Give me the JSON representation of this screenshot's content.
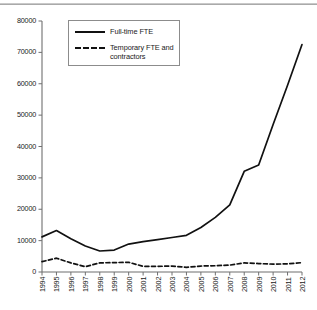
{
  "chart_data": {
    "type": "line",
    "title": "",
    "subtitle": "",
    "xlabel": "",
    "ylabel": "",
    "categories": [
      "1994",
      "1995",
      "1996",
      "1997",
      "1998",
      "1999",
      "2000",
      "2001",
      "2002",
      "2003",
      "2004",
      "2005",
      "2006",
      "2007",
      "2008",
      "2009",
      "2010",
      "2011",
      "2012"
    ],
    "ylim": [
      0,
      80000
    ],
    "ytick_values": [
      0,
      10000,
      20000,
      30000,
      40000,
      50000,
      60000,
      70000,
      80000
    ],
    "ytick_labels": [
      "0",
      "10000",
      "20000",
      "30000",
      "40000",
      "50000",
      "60000",
      "70000",
      "80000"
    ],
    "grid": false,
    "legend_position": "upper-left-inside",
    "series": [
      {
        "name": "Full-time FTE",
        "style": "solid",
        "color": "#111111",
        "values": [
          11200,
          13200,
          10600,
          8300,
          6700,
          7000,
          8900,
          9700,
          10300,
          11000,
          11700,
          14200,
          17400,
          21400,
          32100,
          34100,
          47000,
          59500,
          72500
        ]
      },
      {
        "name": "Temporary FTE and\ncontractors",
        "style": "dashed",
        "color": "#111111",
        "values": [
          3300,
          4400,
          2900,
          1700,
          2900,
          3000,
          3100,
          1800,
          1800,
          1900,
          1500,
          1900,
          2000,
          2200,
          2900,
          2700,
          2500,
          2600,
          3000
        ]
      }
    ]
  },
  "legend": {
    "items": [
      {
        "label": "Full-time FTE"
      },
      {
        "label": "Temporary FTE and\ncontractors"
      }
    ]
  },
  "axes": {
    "y_axis_name": "value-axis",
    "x_axis_name": "year-axis"
  }
}
